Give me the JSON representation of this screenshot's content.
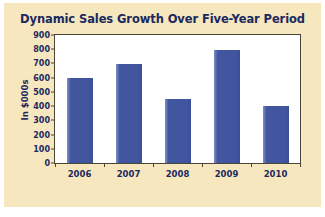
{
  "chart_data": {
    "type": "bar",
    "title": "Dynamic Sales Growth Over Five-Year Period",
    "xlabel": "",
    "ylabel": "In $000s",
    "categories": [
      "2006",
      "2007",
      "2008",
      "2009",
      "2010"
    ],
    "values": [
      595,
      697,
      447,
      797,
      398
    ],
    "ylim": [
      0,
      900
    ],
    "ytick_labels": [
      "0",
      "100",
      "200",
      "300",
      "400",
      "500",
      "600",
      "700",
      "800",
      "900"
    ],
    "ytick_values": [
      0,
      100,
      200,
      300,
      400,
      500,
      600,
      700,
      800,
      900
    ],
    "grid": false,
    "legend": "none",
    "series": [
      {
        "name": "Sales",
        "values": [
          595,
          697,
          447,
          797,
          398
        ]
      }
    ],
    "colors": {
      "bar": "#41569f",
      "bar_highlight": "#7d8fc4",
      "panel_background": "#f7e7be",
      "plot_background": "#ffffff",
      "axis_line": "#4a4637",
      "text": "#1b2a5e",
      "page_background": "#ffffff"
    }
  }
}
